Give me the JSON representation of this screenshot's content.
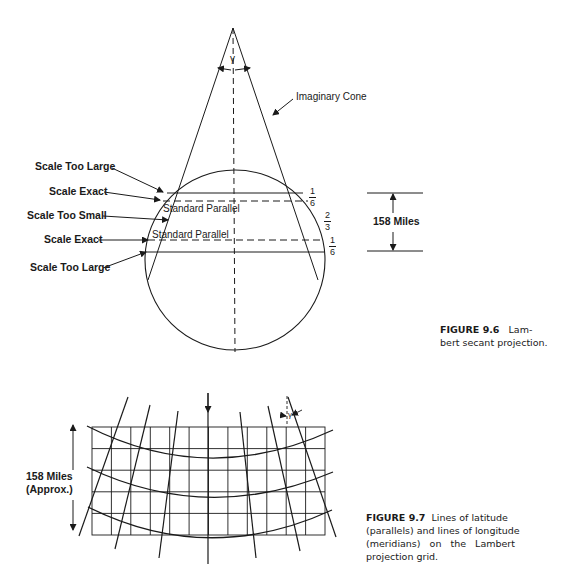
{
  "figure_9_6": {
    "caption_number": "FIGURE 9.6",
    "caption_text_line1": "Lam-",
    "caption_text_line2": "bert secant projection.",
    "cone_label": "Imaginary Cone",
    "angle_symbol": "γ",
    "left_labels": [
      "Scale Too Large",
      "Scale Exact",
      "Scale Too Small",
      "Scale Exact",
      "Scale Too Large"
    ],
    "standard_parallel_upper": "Standard Parallel",
    "standard_parallel_lower": "Standard Parallel",
    "fractions": [
      {
        "num": "1",
        "den": "6"
      },
      {
        "num": "2",
        "den": "3"
      },
      {
        "num": "1",
        "den": "6"
      }
    ],
    "distance_label": "158 Miles"
  },
  "figure_9_7": {
    "caption_number": "FIGURE 9.7",
    "caption_lines": [
      "Lines of latitude",
      "(parallels) and lines of longitude",
      "(meridians)   on   the   Lambert",
      "projection grid."
    ],
    "distance_label_line1": "158 Miles",
    "distance_label_line2": "(Approx.)",
    "angle_symbol": "γ",
    "grid": {
      "columns": 12,
      "rows": 5
    }
  }
}
